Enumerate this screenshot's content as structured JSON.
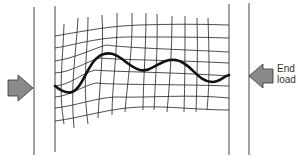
{
  "diagram": {
    "labels": {
      "end_load_line1": "End",
      "end_load_line2": "load"
    },
    "colors": {
      "plate": "#444444",
      "grid": "#222222",
      "fiber": "#111111",
      "arrow_fill": "#8a8a8a",
      "arrow_stroke": "#333333",
      "text": "#333333"
    },
    "elements": {
      "left_arrow": "arrow-right-icon",
      "right_arrow": "arrow-left-icon"
    }
  }
}
